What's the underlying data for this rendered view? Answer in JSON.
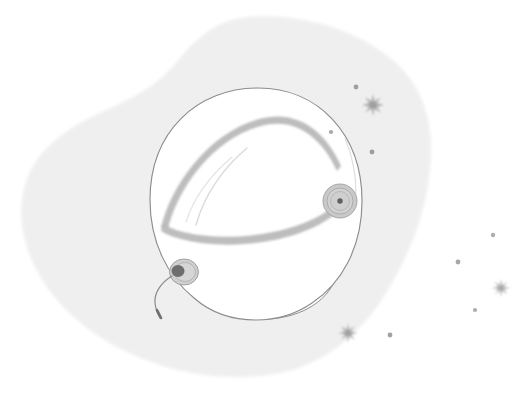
{
  "canvas": {
    "width": 523,
    "height": 399,
    "background_color": "#ffffff",
    "title": "Astronaut Space Helmet Illustration",
    "style": "pencil-sketch-flat-illustration"
  },
  "palette": {
    "page_background": "#ffffff",
    "blob_fill": "#f0f0f0",
    "blob_fill_edge": "#f3f3f3",
    "helmet_fill": "#ffffff",
    "helmet_outline": "#8d8d8d",
    "visor_band": "#b9b9b9",
    "visor_band_outline": "#9a9a9a",
    "knob_ring": "#c9c9c9",
    "knob_inner": "#bcbcbc",
    "knob_center": "#6b6b6b",
    "earpiece_dark": "#707070",
    "wire": "#8a8a8a",
    "star_color": "#9c9c9c",
    "dot_color": "#8a8a8a",
    "highlight_stroke": "#d8d8d8",
    "texture_color": "#e4e4e4"
  },
  "scene": {
    "name": "space-helmet-scene",
    "background_blob": {
      "name": "background-blob",
      "description": "Soft irregular light-gray organic blob filling most of the frame with a concave notch at upper-left",
      "fill": "#f0f0f0",
      "bounds": {
        "x": 14,
        "y": 16,
        "width": 416,
        "height": 360
      },
      "texture": "fine canvas grain"
    },
    "helmet": {
      "name": "astronaut-helmet",
      "center": {
        "x": 255,
        "y": 200
      },
      "bounds": {
        "x": 150,
        "y": 88,
        "width": 212,
        "height": 232
      },
      "fill": "#ffffff",
      "outline_color": "#8d8d8d",
      "outline_width": 1.1,
      "parts": [
        {
          "name": "helmet-dome",
          "label": "Dome"
        },
        {
          "name": "helmet-visor",
          "label": "Visor"
        },
        {
          "name": "visor-band-top",
          "label": "Upper visor band"
        },
        {
          "name": "visor-band-bottom",
          "label": "Lower visor band"
        },
        {
          "name": "visor-highlight",
          "label": "Visor highlight"
        },
        {
          "name": "neck-ring",
          "label": "Neck ring collar"
        },
        {
          "name": "right-knob",
          "label": "Right side knob"
        },
        {
          "name": "left-earpiece",
          "label": "Left earpiece"
        },
        {
          "name": "antenna-wire",
          "label": "Antenna wire"
        }
      ]
    },
    "knobs": [
      {
        "name": "right-side-knob",
        "cx": 340,
        "cy": 201,
        "r": 17,
        "rings": 3,
        "center_dot_r": 2.6,
        "center_color": "#5f5f5f"
      },
      {
        "name": "left-earpiece-knob",
        "cx": 183,
        "cy": 272,
        "r": 14,
        "rings": 2,
        "center_dot_r": 5,
        "center_color": "#6e6e6e"
      }
    ],
    "antenna": {
      "name": "antenna-wire",
      "start": {
        "x": 172,
        "y": 277
      },
      "end": {
        "x": 160,
        "y": 317
      },
      "stroke": "#8a8a8a",
      "tip": "thickened downward hook"
    },
    "stars": [
      {
        "name": "star-upper-right",
        "cx": 373,
        "cy": 105,
        "size": 22,
        "points": 8,
        "opacity": 0.55
      },
      {
        "name": "star-bottom-center",
        "cx": 348,
        "cy": 333,
        "size": 19,
        "points": 8,
        "opacity": 0.5
      },
      {
        "name": "star-right-outer",
        "cx": 501,
        "cy": 288,
        "size": 18,
        "points": 8,
        "opacity": 0.45
      }
    ],
    "dots": [
      {
        "name": "dot-1",
        "cx": 356,
        "cy": 87,
        "r": 2.4
      },
      {
        "name": "dot-2",
        "cx": 331,
        "cy": 132,
        "r": 2.1
      },
      {
        "name": "dot-3",
        "cx": 372,
        "cy": 152,
        "r": 2.4
      },
      {
        "name": "dot-4",
        "cx": 493,
        "cy": 235,
        "r": 2.2
      },
      {
        "name": "dot-5",
        "cx": 458,
        "cy": 262,
        "r": 2.4
      },
      {
        "name": "dot-6",
        "cx": 475,
        "cy": 310,
        "r": 2.1
      },
      {
        "name": "dot-7",
        "cx": 390,
        "cy": 335,
        "r": 2.4
      }
    ]
  },
  "chart_data": null
}
